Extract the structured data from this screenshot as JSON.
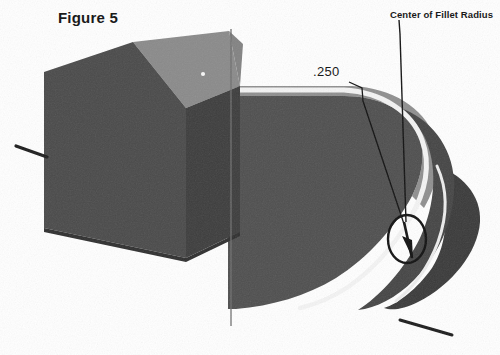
{
  "figure": {
    "title": "Figure 5",
    "background_color": "#ffffff"
  },
  "annotations": {
    "dimension_label": ".250",
    "callout_label": "Center of Fillet Radius"
  },
  "geometry": {
    "block_top_face_color": "#8a8a8a",
    "block_left_face_color": "#4a4a4a",
    "block_right_face_color": "#3d3d3d",
    "extrusion_top_face_color": "#8f8f8f",
    "extrusion_body_color": "#4f4f4f",
    "end_cap_color": "#3a3a3a",
    "highlight_color": "#f2f2f2",
    "line_color": "#1a1a1a"
  }
}
